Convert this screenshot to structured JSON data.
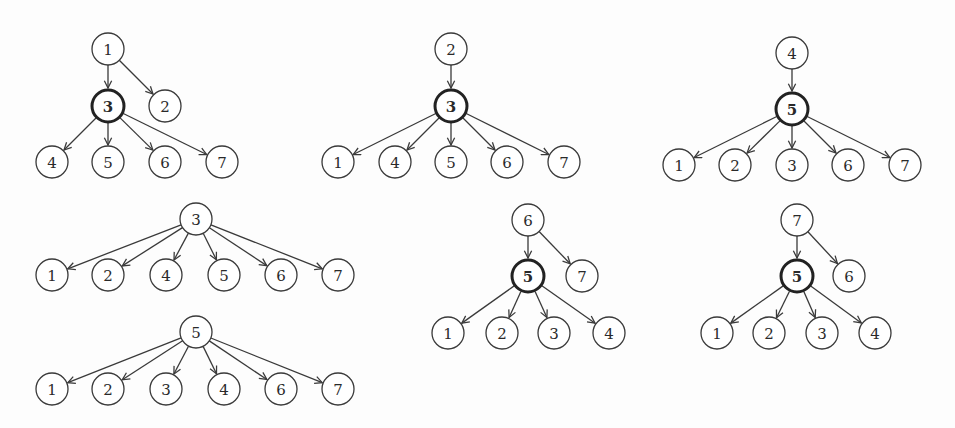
{
  "diagram": {
    "title": "",
    "node_radius": 16,
    "trees": [
      {
        "id": "tree-a",
        "nodes": [
          {
            "id": "a1",
            "label": "1",
            "x": 108,
            "y": 49,
            "bold": false
          },
          {
            "id": "a3",
            "label": "3",
            "x": 108,
            "y": 106,
            "bold": true
          },
          {
            "id": "a2",
            "label": "2",
            "x": 165,
            "y": 106,
            "bold": false
          },
          {
            "id": "a4",
            "label": "4",
            "x": 52,
            "y": 162,
            "bold": false
          },
          {
            "id": "a5",
            "label": "5",
            "x": 108,
            "y": 162,
            "bold": false
          },
          {
            "id": "a6",
            "label": "6",
            "x": 165,
            "y": 162,
            "bold": false
          },
          {
            "id": "a7",
            "label": "7",
            "x": 222,
            "y": 162,
            "bold": false
          }
        ],
        "edges": [
          [
            "a1",
            "a3"
          ],
          [
            "a1",
            "a2"
          ],
          [
            "a3",
            "a4"
          ],
          [
            "a3",
            "a5"
          ],
          [
            "a3",
            "a6"
          ],
          [
            "a3",
            "a7"
          ]
        ]
      },
      {
        "id": "tree-b",
        "nodes": [
          {
            "id": "b2",
            "label": "2",
            "x": 451,
            "y": 49,
            "bold": false
          },
          {
            "id": "b3",
            "label": "3",
            "x": 451,
            "y": 106,
            "bold": true
          },
          {
            "id": "b1",
            "label": "1",
            "x": 338,
            "y": 162,
            "bold": false
          },
          {
            "id": "b4",
            "label": "4",
            "x": 395,
            "y": 162,
            "bold": false
          },
          {
            "id": "b5",
            "label": "5",
            "x": 451,
            "y": 162,
            "bold": false
          },
          {
            "id": "b6",
            "label": "6",
            "x": 507,
            "y": 162,
            "bold": false
          },
          {
            "id": "b7",
            "label": "7",
            "x": 564,
            "y": 162,
            "bold": false
          }
        ],
        "edges": [
          [
            "b2",
            "b3"
          ],
          [
            "b3",
            "b1"
          ],
          [
            "b3",
            "b4"
          ],
          [
            "b3",
            "b5"
          ],
          [
            "b3",
            "b6"
          ],
          [
            "b3",
            "b7"
          ]
        ]
      },
      {
        "id": "tree-c",
        "nodes": [
          {
            "id": "c4",
            "label": "4",
            "x": 792,
            "y": 53,
            "bold": false
          },
          {
            "id": "c5",
            "label": "5",
            "x": 792,
            "y": 109,
            "bold": true
          },
          {
            "id": "c1",
            "label": "1",
            "x": 679,
            "y": 165,
            "bold": false
          },
          {
            "id": "c2",
            "label": "2",
            "x": 735,
            "y": 165,
            "bold": false
          },
          {
            "id": "c3",
            "label": "3",
            "x": 792,
            "y": 165,
            "bold": false
          },
          {
            "id": "c6",
            "label": "6",
            "x": 848,
            "y": 165,
            "bold": false
          },
          {
            "id": "c7",
            "label": "7",
            "x": 905,
            "y": 165,
            "bold": false
          }
        ],
        "edges": [
          [
            "c4",
            "c5"
          ],
          [
            "c5",
            "c1"
          ],
          [
            "c5",
            "c2"
          ],
          [
            "c5",
            "c3"
          ],
          [
            "c5",
            "c6"
          ],
          [
            "c5",
            "c7"
          ]
        ]
      },
      {
        "id": "tree-d",
        "nodes": [
          {
            "id": "d3",
            "label": "3",
            "x": 196,
            "y": 219,
            "bold": false
          },
          {
            "id": "d1",
            "label": "1",
            "x": 52,
            "y": 275,
            "bold": false
          },
          {
            "id": "d2",
            "label": "2",
            "x": 108,
            "y": 275,
            "bold": false
          },
          {
            "id": "d4",
            "label": "4",
            "x": 166,
            "y": 275,
            "bold": false
          },
          {
            "id": "d5",
            "label": "5",
            "x": 224,
            "y": 275,
            "bold": false
          },
          {
            "id": "d6",
            "label": "6",
            "x": 281,
            "y": 275,
            "bold": false
          },
          {
            "id": "d7",
            "label": "7",
            "x": 338,
            "y": 275,
            "bold": false
          }
        ],
        "edges": [
          [
            "d3",
            "d1"
          ],
          [
            "d3",
            "d2"
          ],
          [
            "d3",
            "d4"
          ],
          [
            "d3",
            "d5"
          ],
          [
            "d3",
            "d6"
          ],
          [
            "d3",
            "d7"
          ]
        ]
      },
      {
        "id": "tree-e",
        "nodes": [
          {
            "id": "e5",
            "label": "5",
            "x": 196,
            "y": 332,
            "bold": false
          },
          {
            "id": "e1",
            "label": "1",
            "x": 52,
            "y": 389,
            "bold": false
          },
          {
            "id": "e2",
            "label": "2",
            "x": 108,
            "y": 389,
            "bold": false
          },
          {
            "id": "e3",
            "label": "3",
            "x": 166,
            "y": 389,
            "bold": false
          },
          {
            "id": "e4",
            "label": "4",
            "x": 224,
            "y": 389,
            "bold": false
          },
          {
            "id": "e6",
            "label": "6",
            "x": 281,
            "y": 389,
            "bold": false
          },
          {
            "id": "e7",
            "label": "7",
            "x": 338,
            "y": 389,
            "bold": false
          }
        ],
        "edges": [
          [
            "e5",
            "e1"
          ],
          [
            "e5",
            "e2"
          ],
          [
            "e5",
            "e3"
          ],
          [
            "e5",
            "e4"
          ],
          [
            "e5",
            "e6"
          ],
          [
            "e5",
            "e7"
          ]
        ]
      },
      {
        "id": "tree-f",
        "nodes": [
          {
            "id": "f6",
            "label": "6",
            "x": 528,
            "y": 220,
            "bold": false
          },
          {
            "id": "f5",
            "label": "5",
            "x": 528,
            "y": 276,
            "bold": true
          },
          {
            "id": "f7",
            "label": "7",
            "x": 582,
            "y": 276,
            "bold": false
          },
          {
            "id": "f1",
            "label": "1",
            "x": 448,
            "y": 333,
            "bold": false
          },
          {
            "id": "f2",
            "label": "2",
            "x": 502,
            "y": 333,
            "bold": false
          },
          {
            "id": "f3",
            "label": "3",
            "x": 554,
            "y": 333,
            "bold": false
          },
          {
            "id": "f4",
            "label": "4",
            "x": 609,
            "y": 333,
            "bold": false
          }
        ],
        "edges": [
          [
            "f6",
            "f5"
          ],
          [
            "f6",
            "f7"
          ],
          [
            "f5",
            "f1"
          ],
          [
            "f5",
            "f2"
          ],
          [
            "f5",
            "f3"
          ],
          [
            "f5",
            "f4"
          ]
        ]
      },
      {
        "id": "tree-g",
        "nodes": [
          {
            "id": "g7",
            "label": "7",
            "x": 797,
            "y": 220,
            "bold": false
          },
          {
            "id": "g5",
            "label": "5",
            "x": 797,
            "y": 276,
            "bold": true
          },
          {
            "id": "g6",
            "label": "6",
            "x": 849,
            "y": 276,
            "bold": false
          },
          {
            "id": "g1",
            "label": "1",
            "x": 717,
            "y": 333,
            "bold": false
          },
          {
            "id": "g2",
            "label": "2",
            "x": 769,
            "y": 333,
            "bold": false
          },
          {
            "id": "g3",
            "label": "3",
            "x": 822,
            "y": 333,
            "bold": false
          },
          {
            "id": "g4",
            "label": "4",
            "x": 875,
            "y": 333,
            "bold": false
          }
        ],
        "edges": [
          [
            "g7",
            "g5"
          ],
          [
            "g7",
            "g6"
          ],
          [
            "g5",
            "g1"
          ],
          [
            "g5",
            "g2"
          ],
          [
            "g5",
            "g3"
          ],
          [
            "g5",
            "g4"
          ]
        ]
      }
    ]
  }
}
